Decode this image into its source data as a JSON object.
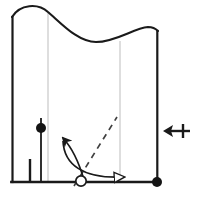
{
  "figure": {
    "title": "",
    "caption": "",
    "background_color": "#ffffff",
    "stroke_color": "#1a1a1a",
    "gridline_color": "#c8c8c8",
    "dashed_color": "#404040",
    "width": 200,
    "height": 199
  },
  "frame": {
    "name": "domain-boundary",
    "left_wall_x": 12,
    "right_wall_x": 158,
    "baseline_y": 182,
    "left_wall_top_y": 17,
    "right_wall_top_y": 31
  },
  "top_surface": {
    "name": "wavy-top-surface",
    "description": "sinusoidal deformed upper boundary",
    "path": "M 12 17 C 20 4 38 3 48 12 C 62 24 78 42 96 42 C 116 42 134 28 148 27 C 153 27 156 29 158 31",
    "crest_x": 48,
    "trough_x": 120
  },
  "gridlines": [
    {
      "name": "gridline-left",
      "x": 48,
      "y_top": 12,
      "y_bottom": 182
    },
    {
      "name": "gridline-right",
      "x": 120,
      "y_top": 41,
      "y_bottom": 182
    }
  ],
  "vertical_markers": [
    {
      "name": "marker-stem-short",
      "x": 30,
      "y_top": 159,
      "y_bottom": 182,
      "width": 2.4
    },
    {
      "name": "marker-stem-tall",
      "x": 41,
      "y_top": 117,
      "y_bottom": 182,
      "width": 1.8
    }
  ],
  "nodes": [
    {
      "name": "filled-node-left",
      "type": "filled-circle",
      "x": 41,
      "y": 128,
      "r": 5.0
    },
    {
      "name": "open-node-base",
      "type": "open-circle",
      "x": 81,
      "y": 181,
      "r": 5.2
    },
    {
      "name": "filled-node-corner",
      "type": "filled-circle",
      "x": 157,
      "y": 182,
      "r": 5.0
    }
  ],
  "dashed_line": {
    "name": "dashed-trajectory",
    "x1": 74,
    "y1": 186,
    "x2": 117,
    "y2": 117,
    "dash_pattern": "6 5"
  },
  "curved_arrows": [
    {
      "name": "curved-arrow-up-left",
      "head_style": "solid",
      "path": "M 84 180 C 80 166 74 150 63 138",
      "tip_x": 60,
      "tip_y": 134
    },
    {
      "name": "curved-arrow-right",
      "head_style": "open",
      "path": "M 63 140 C 64 164 80 178 125 177",
      "tip_x": 136,
      "tip_y": 177
    }
  ],
  "side_symbol": {
    "name": "left-arrow-with-plus-icon",
    "label": "leftwards arrow with plus tail",
    "x": 163,
    "y": 131,
    "width": 28,
    "height": 14,
    "glyph": "↤"
  },
  "legend": {
    "visible": false,
    "entries": []
  }
}
